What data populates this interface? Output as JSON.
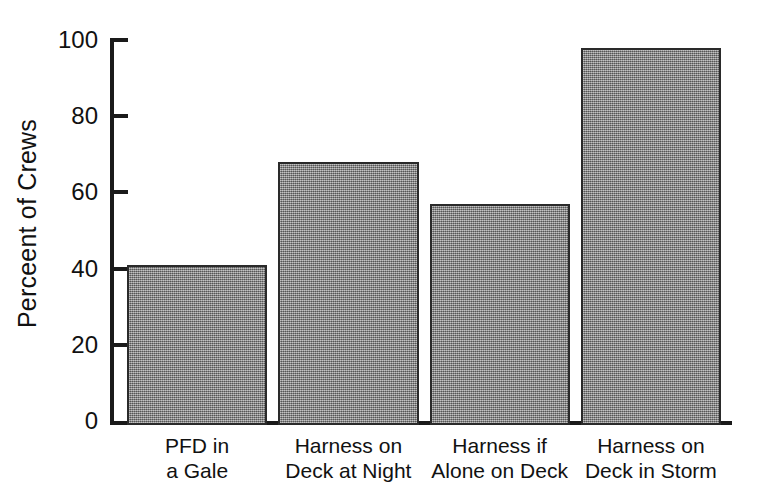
{
  "chart_data": {
    "type": "bar",
    "title": "",
    "xlabel": "",
    "ylabel": "Perceent of Crews",
    "ylim": [
      0,
      100
    ],
    "yticks": [
      0,
      20,
      40,
      60,
      80,
      100
    ],
    "ytick_labels": [
      "0",
      "20",
      "40",
      "60",
      "80",
      "100"
    ],
    "grid": false,
    "legend": false,
    "categories": [
      "PFD in a Gale",
      "Harness on Deck at Night",
      "Harness if Alone on Deck",
      "Harness on Deck in Storm"
    ],
    "category_lines": [
      [
        "PFD in",
        "a Gale"
      ],
      [
        "Harness on",
        "Deck at Night"
      ],
      [
        "Harness if",
        "Alone on Deck"
      ],
      [
        "Harness on",
        "Deck in Storm"
      ]
    ],
    "values": [
      42,
      69,
      58,
      99
    ],
    "bar_fill_color": "#8a8a8a",
    "bar_edge_color": "#2a2a2a",
    "axis_color": "#1a1a1a",
    "background_color": "#ffffff"
  }
}
